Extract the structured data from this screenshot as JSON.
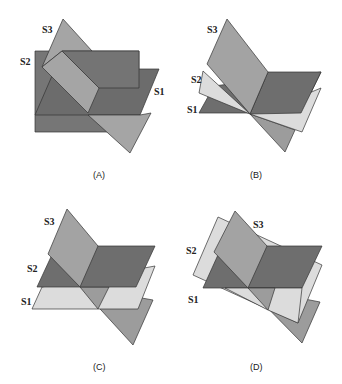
{
  "figure": {
    "panels": [
      {
        "id": "A",
        "caption": "(A)",
        "labels": {
          "s1": "S1",
          "s2": "S2",
          "s3": "S3"
        }
      },
      {
        "id": "B",
        "caption": "(B)",
        "labels": {
          "s1": "S1",
          "s2": "S2",
          "s3": "S3"
        }
      },
      {
        "id": "C",
        "caption": "(C)",
        "labels": {
          "s1": "S1",
          "s2": "S2",
          "s3": "S3"
        }
      },
      {
        "id": "D",
        "caption": "(D)",
        "labels": {
          "s1": "S1",
          "s2": "S2",
          "s3": "S3"
        }
      }
    ],
    "colors": {
      "dark": "#6e6e6e",
      "medium": "#a3a3a3",
      "light": "#dcdcdc",
      "stroke": "#333333"
    }
  }
}
